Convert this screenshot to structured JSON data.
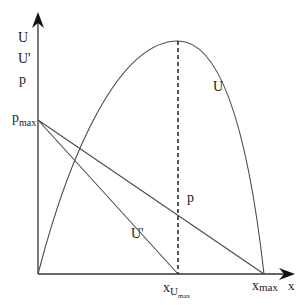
{
  "diagram": {
    "type": "economics-function-plot",
    "colors": {
      "background": "#ffffff",
      "line": "#4a4a4a",
      "axis": "#333333",
      "text": "#222222"
    },
    "axes": {
      "y_label_lines": [
        "U",
        "U'",
        "p"
      ],
      "x_label": "x"
    },
    "points": {
      "origin": {
        "x": 38,
        "y": 274
      },
      "p_max": {
        "x": 38,
        "y": 120
      },
      "x_Umax": {
        "x": 178,
        "y": 274
      },
      "x_max": {
        "x": 264,
        "y": 274
      },
      "U_peak": {
        "x": 178,
        "y": 41
      }
    },
    "curves": {
      "U": {
        "label": "U",
        "shape": "parabola",
        "from": "origin",
        "peak": "U_peak",
        "to": "x_max"
      },
      "U_prime": {
        "label": "U'",
        "shape": "line",
        "from": "p_max",
        "to": "x_Umax"
      },
      "p": {
        "label": "p",
        "shape": "line",
        "from": "p_max",
        "to": "x_max"
      },
      "dashed_guide": {
        "shape": "dashed-vertical",
        "from": "U_peak",
        "to": "x_Umax"
      }
    },
    "labels": {
      "U_curve": "U",
      "U_prime_line": "U'",
      "p_line": "p",
      "p_max_main": "p",
      "p_max_sub": "max",
      "x_Umax_main": "x",
      "x_Umax_sub": "U",
      "x_Umax_subsub": "max",
      "x_max_main": "x",
      "x_max_sub": "max",
      "x_axis": "x"
    }
  }
}
